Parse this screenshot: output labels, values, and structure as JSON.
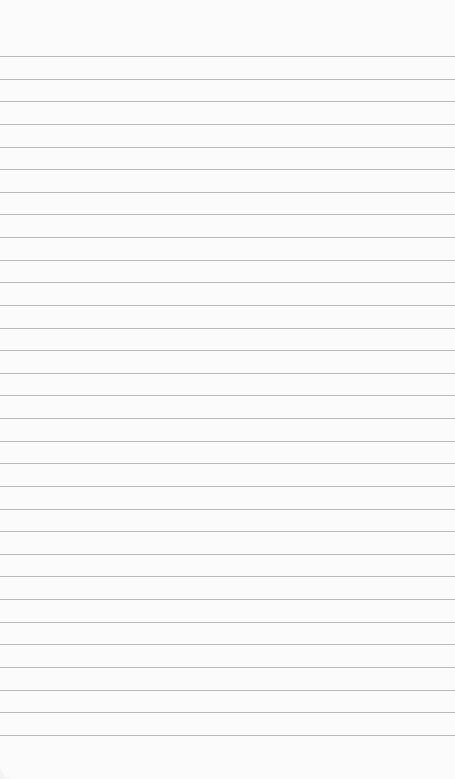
{
  "paper": {
    "type": "lined-paper",
    "line_count": 31,
    "first_line_y": 56,
    "line_spacing": 22.63,
    "line_color": "#b9b9b9",
    "background_color": "#fbfbfb"
  }
}
